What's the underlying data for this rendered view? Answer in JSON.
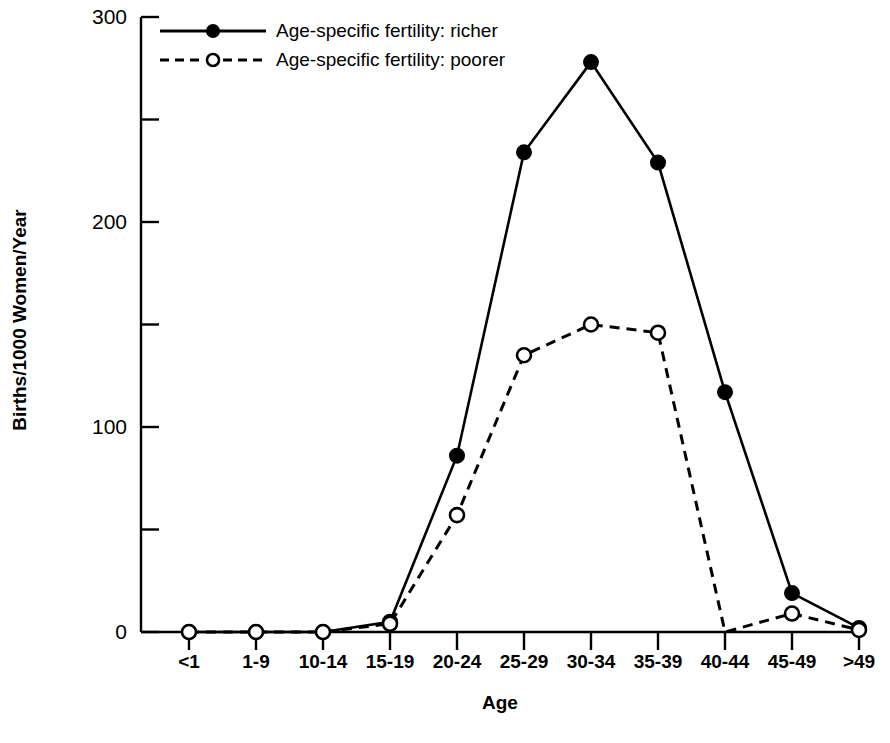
{
  "chart_data": {
    "type": "line",
    "title": "",
    "xlabel": "Age",
    "ylabel": "Births/1000 Women/Year",
    "categories": [
      "<1",
      "1-9",
      "10-14",
      "15-19",
      "20-24",
      "25-29",
      "30-34",
      "35-39",
      "40-44",
      "45-49",
      ">49"
    ],
    "ylim": [
      0,
      300
    ],
    "ytick_major": [
      0,
      100,
      200,
      300
    ],
    "ytick_minor": [
      50,
      150,
      250
    ],
    "ytick_labels": [
      "0",
      "100",
      "200",
      "300"
    ],
    "grid": false,
    "legend_position": "top-left inside",
    "series": [
      {
        "name": "Age-specific fertility: richer",
        "style": "solid",
        "marker": "filled-circle",
        "color": "#000000",
        "values": [
          0,
          0,
          0,
          5,
          86,
          234,
          278,
          229,
          117,
          19,
          2
        ]
      },
      {
        "name": "Age-specific fertility: poorer",
        "style": "dashed",
        "marker": "open-circle",
        "color": "#000000",
        "values": [
          0,
          0,
          0,
          4,
          57,
          135,
          150,
          146,
          0,
          9,
          1
        ]
      }
    ]
  },
  "legend": {
    "items": [
      {
        "label": "Age-specific fertility: richer",
        "sample": "solid-line-filled-circle"
      },
      {
        "label": "Age-specific fertility: poorer",
        "sample": "dashed-line-open-circle"
      }
    ]
  },
  "axes": {
    "y_title": "Births/1000 Women/Year",
    "x_title": "Age",
    "y_labels": [
      "300",
      "200",
      "100",
      "0"
    ],
    "x_labels": [
      "<1",
      "1-9",
      "10-14",
      "15-19",
      "20-24",
      "25-29",
      "30-34",
      "35-39",
      "40-44",
      "45-49",
      ">49"
    ]
  }
}
